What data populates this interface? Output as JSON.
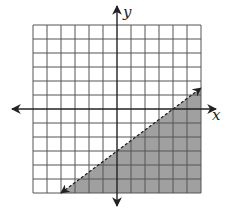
{
  "chart_data": {
    "type": "line",
    "title": "",
    "xlabel": "x",
    "ylabel": "y",
    "xlim": [
      -6,
      6
    ],
    "ylim": [
      -6,
      6
    ],
    "grid": true,
    "grid_step": 1,
    "boundary_line": {
      "equation": "y = (3/4)x - 3",
      "slope": 0.75,
      "y_intercept": -3,
      "x_intercept": 4,
      "style": "dashed",
      "points": [
        [
          -4,
          -6
        ],
        [
          0,
          -3
        ],
        [
          4,
          0
        ],
        [
          6,
          1.5
        ]
      ],
      "arrows": "both"
    },
    "shaded_region": {
      "side": "below",
      "inequality": "y < (3/4)x - 3",
      "color": "#a0a0a0"
    }
  },
  "labels": {
    "x_axis": "x",
    "y_axis": "y"
  },
  "colors": {
    "grid": "#555555",
    "axis": "#222222",
    "shade": "#a0a0a0",
    "line": "#222222"
  }
}
